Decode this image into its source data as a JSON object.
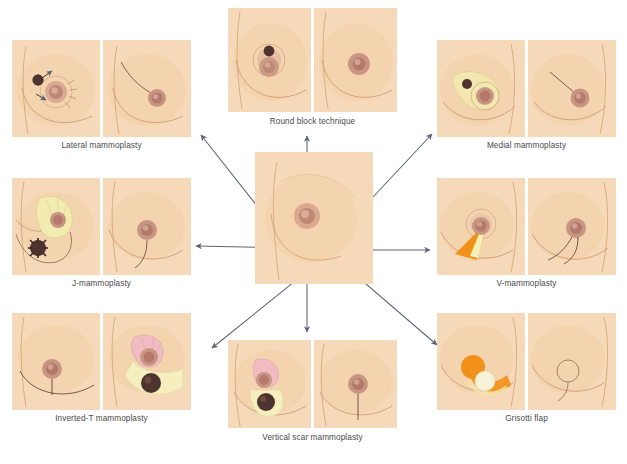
{
  "figure": {
    "background_color": "#ffffff",
    "skin_color": "#f6d9b8",
    "skin_shadow_color": "#e7bd93",
    "areola_color": "#c89a84",
    "nipple_color": "#b4796a",
    "tumor_color": "#4e342e",
    "gland_yellow": "#f2ecb0",
    "flap_orange": "#f2911a",
    "flap_pink": "#f0bcc2",
    "flap_cream": "#f7efc9",
    "arrow_color": "#5c6378",
    "caption_color": "#4a4a4a"
  },
  "center": {
    "name": "central-breast-diagram",
    "arrow_count": 7
  },
  "panels": [
    {
      "id": "lateral",
      "label": "Lateral mammoplasty",
      "position": "top-left",
      "figures": [
        {
          "role": "pre-operative",
          "markings": [
            "tumor",
            "periareolar-circle",
            "radiating-incision-lines",
            "arrows"
          ]
        },
        {
          "role": "post-operative",
          "markings": [
            "lateral-scar"
          ]
        }
      ]
    },
    {
      "id": "round-block",
      "label": "Round block technique",
      "position": "top-center",
      "figures": [
        {
          "role": "pre-operative",
          "markings": [
            "tumor",
            "concentric-periareolar-rings"
          ]
        },
        {
          "role": "post-operative",
          "markings": [
            "periareolar-scar"
          ]
        }
      ]
    },
    {
      "id": "medial",
      "label": "Medial mammoplasty",
      "position": "top-right",
      "figures": [
        {
          "role": "pre-operative",
          "markings": [
            "tumor",
            "medial-gland-flap",
            "periareolar-circle"
          ]
        },
        {
          "role": "post-operative",
          "markings": [
            "medial-scar"
          ]
        }
      ]
    },
    {
      "id": "j-mammoplasty",
      "label": "J-mammoplasty",
      "position": "mid-left",
      "figures": [
        {
          "role": "pre-operative",
          "markings": [
            "tumor",
            "superior-gland-pedicle",
            "j-shaped-incision"
          ]
        },
        {
          "role": "post-operative",
          "markings": [
            "j-shaped-scar"
          ]
        }
      ]
    },
    {
      "id": "v-mammoplasty",
      "label": "V-mammoplasty",
      "position": "mid-right",
      "figures": [
        {
          "role": "pre-operative",
          "markings": [
            "v-wedge-resection",
            "periareolar-circle"
          ]
        },
        {
          "role": "post-operative",
          "markings": [
            "v-shaped-scar"
          ]
        }
      ]
    },
    {
      "id": "inverted-t",
      "label": "Inverted-T mammoplasty",
      "position": "bottom-left",
      "figures": [
        {
          "role": "post-operative",
          "markings": [
            "inverted-t-scar"
          ]
        },
        {
          "role": "pre-operative",
          "markings": [
            "tumor",
            "superior-pedicle",
            "inferior-gland-resection"
          ]
        }
      ]
    },
    {
      "id": "vertical-scar",
      "label": "Vertical scar mammoplasty",
      "position": "bottom-center",
      "figures": [
        {
          "role": "pre-operative",
          "markings": [
            "tumor",
            "superior-pedicle",
            "vertical-resection"
          ]
        },
        {
          "role": "post-operative",
          "markings": [
            "vertical-scar"
          ]
        }
      ]
    },
    {
      "id": "grisotti",
      "label": "Grisotti flap",
      "position": "bottom-right",
      "figures": [
        {
          "role": "pre-operative",
          "markings": [
            "central-tumor-disc",
            "rotation-flap",
            "skin-island"
          ]
        },
        {
          "role": "post-operative",
          "markings": [
            "circular-scar",
            "vertical-scar"
          ]
        }
      ]
    }
  ]
}
